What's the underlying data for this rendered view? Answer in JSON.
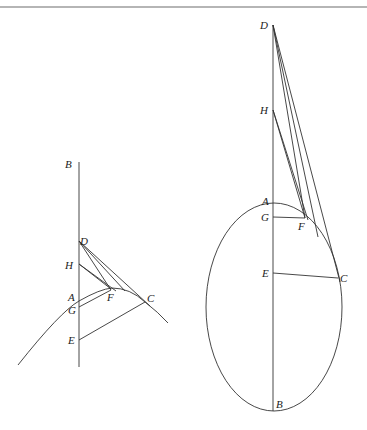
{
  "figures": [
    {
      "id": "left",
      "description": "Arc of a curve with axis BE, tangent from D to C",
      "labels": {
        "B": "B",
        "D": "D",
        "H": "H",
        "A": "A",
        "G": "G",
        "F": "F",
        "C": "C",
        "E": "E"
      }
    },
    {
      "id": "right",
      "description": "Ellipse with major axis AB, tangent lines from D and H",
      "labels": {
        "D": "D",
        "H": "H",
        "A": "A",
        "G": "G",
        "F": "F",
        "E": "E",
        "C": "C",
        "B": "B"
      }
    }
  ],
  "colors": {
    "stroke": "#333333",
    "text": "#222222",
    "rule": "#b5b5b5"
  }
}
